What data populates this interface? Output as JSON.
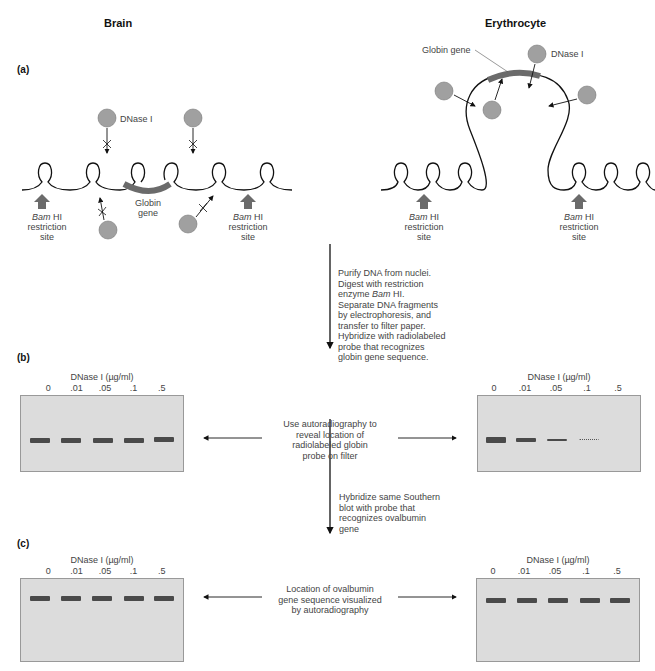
{
  "headings": {
    "left": "Brain",
    "right": "Erythrocyte"
  },
  "panels": {
    "a": "(a)",
    "b": "(b)",
    "c": "(c)"
  },
  "brain": {
    "dnase_label": "DNase I",
    "globin_label_line1": "Globin",
    "globin_label_line2": "gene",
    "restriction_left": {
      "line1_italic": "Bam",
      "line1_rest": " HI",
      "line2": "restriction",
      "line3": "site"
    },
    "restriction_right": {
      "line1_italic": "Bam",
      "line1_rest": " HI",
      "line2": "restriction",
      "line3": "site"
    }
  },
  "erythrocyte": {
    "dnase_label": "DNase I",
    "globin_label": "Globin gene",
    "restriction_left": {
      "line1_italic": "Bam",
      "line1_rest": " HI",
      "line2": "restriction",
      "line3": "site"
    },
    "restriction_right": {
      "line1_italic": "Bam",
      "line1_rest": " HI",
      "line2": "restriction",
      "line3": "site"
    }
  },
  "steps": {
    "purify": {
      "lines": [
        "Purify DNA from nuclei.",
        "Digest with restriction",
        "enzyme ",
        "Separate DNA fragments",
        "by electrophoresis, and",
        "transfer to filter paper.",
        "Hybridize with radiolabeled",
        "probe that recognizes",
        "globin gene sequence."
      ],
      "enzyme_italic": "Bam",
      "enzyme_rest": " HI."
    },
    "autoradiography": {
      "lines": [
        "Use autoradiography to",
        "reveal location of",
        "radiolabeled globin",
        "probe on filter"
      ]
    },
    "hybridize_ovalbumin": {
      "lines": [
        "Hybridize same Southern",
        "blot with probe that",
        "recognizes ovalbumin",
        "gene"
      ]
    },
    "ovalbumin_location": {
      "lines": [
        "Location of ovalbumin",
        "gene sequence visualized",
        "by autoradiography"
      ]
    }
  },
  "gel": {
    "title": "DNase I (µg/ml)",
    "lanes": [
      "0",
      ".01",
      ".05",
      ".1",
      ".5"
    ]
  },
  "colors": {
    "gel_bg": "#dcdcdc",
    "band": "#4a4a4a",
    "dnase_circle": "#a0a0a0",
    "globin_gene": "#6b6b6b",
    "restriction_arrow": "#6b6b6b"
  }
}
